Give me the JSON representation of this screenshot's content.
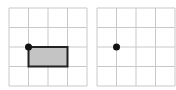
{
  "colors": {
    "grid": "#c8c8c8",
    "rect_fill": "#c4c4c4",
    "rect_stroke": "#222222",
    "dot": "#111111"
  },
  "grids": [
    {
      "name": "left-grid",
      "x": 9,
      "y": 8,
      "cols": 4,
      "rows": 4,
      "cell": 19.5,
      "point": {
        "col": 1,
        "row": 2
      },
      "rectangle": {
        "col": 1,
        "row": 2,
        "w": 2,
        "h": 1
      }
    },
    {
      "name": "right-grid",
      "x": 97,
      "y": 8,
      "cols": 4,
      "rows": 4,
      "cell": 19.5,
      "point": {
        "col": 1,
        "row": 2
      }
    }
  ]
}
